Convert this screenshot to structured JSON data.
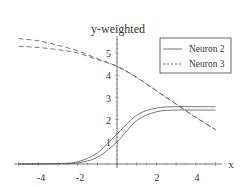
{
  "chart_data": {
    "type": "line",
    "title": "y-weighted",
    "xlabel": "x",
    "ylabel": "",
    "xlim": [
      -5.2,
      5.1
    ],
    "ylim": [
      0,
      5.8
    ],
    "x_ticks": [
      -4,
      -2,
      2,
      4
    ],
    "y_ticks": [
      1,
      2,
      3,
      4,
      5
    ],
    "grid": false,
    "legend_position": "upper right",
    "legend": [
      {
        "label": "Neuron 2",
        "style": "solid"
      },
      {
        "label": "Neuron  3",
        "style": "dashed"
      }
    ],
    "series": [
      {
        "name": "Neuron 2 (upper)",
        "style": "solid",
        "x": [
          -5,
          -3,
          -2,
          -1,
          0,
          1,
          2,
          3,
          4,
          5
        ],
        "y": [
          0,
          0.02,
          0.1,
          0.5,
          1.35,
          2.2,
          2.52,
          2.58,
          2.58,
          2.58
        ]
      },
      {
        "name": "Neuron 2 (lower)",
        "style": "solid",
        "x": [
          -5,
          -3,
          -2,
          -1,
          0,
          1,
          2,
          3,
          4,
          5
        ],
        "y": [
          0,
          0.01,
          0.05,
          0.3,
          1.0,
          1.95,
          2.35,
          2.43,
          2.43,
          2.43
        ]
      },
      {
        "name": "Neuron 3 (upper)",
        "style": "dashed",
        "x": [
          -5,
          -4,
          -3,
          -2,
          -1,
          0,
          1,
          2,
          3,
          4,
          5
        ],
        "y": [
          5.65,
          5.55,
          5.35,
          5.1,
          4.75,
          4.4,
          3.9,
          3.3,
          2.7,
          2.1,
          1.55
        ]
      },
      {
        "name": "Neuron 3 (lower)",
        "style": "dashed",
        "x": [
          -5,
          -4,
          -3,
          -2,
          -1,
          0,
          1,
          2,
          3,
          4,
          5
        ],
        "y": [
          5.3,
          5.25,
          5.15,
          5.0,
          4.7,
          4.4,
          3.9,
          3.3,
          2.7,
          2.1,
          1.55
        ]
      }
    ]
  },
  "labels": {
    "title": "y-weighted",
    "xlabel": "x",
    "legend_1": "Neuron 2",
    "legend_2": "Neuron  3",
    "xt_m4": "-4",
    "xt_m2": "-2",
    "xt_2": "2",
    "xt_4": "4",
    "yt_1": "1",
    "yt_2": "2",
    "yt_3": "3",
    "yt_4": "4",
    "yt_5": "5"
  }
}
